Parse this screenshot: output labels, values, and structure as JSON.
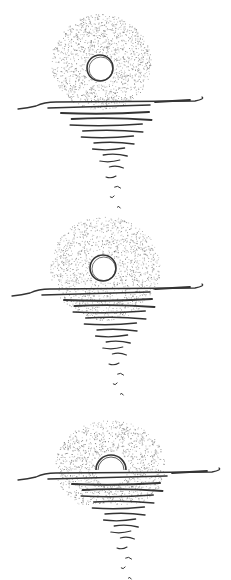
{
  "style": {
    "ink": "#333333",
    "stipple": "#6a6a6a",
    "background": "#ffffff"
  },
  "panels": [
    {
      "name": "panel-sun-above-horizon",
      "sun_phase": "full",
      "sun_visible_fraction": 1.0
    },
    {
      "name": "panel-sun-touching-horizon",
      "sun_phase": "touching",
      "sun_visible_fraction": 1.0
    },
    {
      "name": "panel-sun-half-set",
      "sun_phase": "half",
      "sun_visible_fraction": 0.5
    }
  ]
}
